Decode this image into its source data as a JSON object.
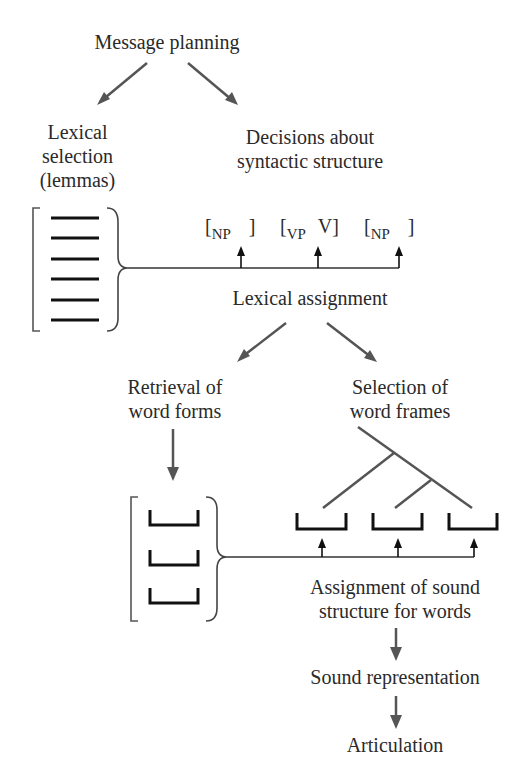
{
  "diagram": {
    "nodes": {
      "message_planning": "Message planning",
      "lexical_selection": [
        "Lexical",
        "selection",
        "(lemmas)"
      ],
      "syntactic_decisions": [
        "Decisions about",
        "syntactic structure"
      ],
      "lexical_assignment": "Lexical assignment",
      "retrieval_word_forms": [
        "Retrieval of",
        "word forms"
      ],
      "selection_word_frames": [
        "Selection of",
        "word frames"
      ],
      "assignment_sound_structure": [
        "Assignment of sound",
        "structure for words"
      ],
      "sound_representation": "Sound representation",
      "articulation": "Articulation"
    },
    "syntactic_slots": [
      {
        "open": "[",
        "sub": "NP",
        "head": "",
        "close": "]"
      },
      {
        "open": "[",
        "sub": "VP",
        "head": "V",
        "close": "]"
      },
      {
        "open": "[",
        "sub": "NP",
        "head": "",
        "close": "]"
      }
    ],
    "lemma_list_count": 6,
    "word_form_slots_count": 3,
    "word_frame_slots_count": 3,
    "colors": {
      "text": "#2a2a2a",
      "arrow": "#555555",
      "line": "#3a3a3a",
      "slot": "#1a1a1a"
    }
  }
}
